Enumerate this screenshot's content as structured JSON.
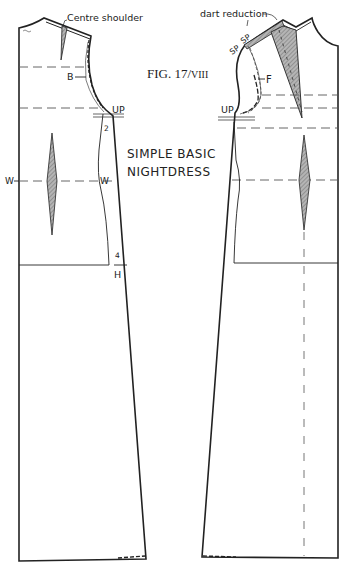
{
  "figure": {
    "title_main": "FIG. 17/",
    "title_roman": "VIII",
    "subtitle_line1": "SIMPLE BASIC",
    "subtitle_line2": "NIGHTDRESS"
  },
  "back_piece": {
    "annotation_centre_shoulder": "Centre shoulder",
    "label_bust": "B",
    "label_underarm": "UP",
    "label_underarm_measure": "2",
    "label_waist_left": "W",
    "label_waist_right": "W",
    "label_hip_measure": "4",
    "label_hip": "H"
  },
  "front_piece": {
    "annotation_dart_reduction": "dart reduction",
    "label_shoulder_point_1": "SP",
    "label_shoulder_point_2": "SP",
    "label_front": "F",
    "label_underarm": "UP"
  },
  "colors": {
    "ink": "#222222",
    "shading": "#9a9a9a",
    "dash": "#555555",
    "paper": "#ffffff"
  }
}
